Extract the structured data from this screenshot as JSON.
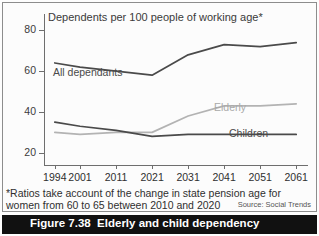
{
  "chart_data": {
    "type": "line",
    "title": "Dependents per 100 people of working age*",
    "xlabel": "",
    "ylabel": "",
    "x": [
      1994,
      2001,
      2011,
      2021,
      2031,
      2041,
      2051,
      2061
    ],
    "xticklabels": [
      "1994",
      "2001",
      "2011",
      "2021",
      "2031",
      "2041",
      "2051",
      "2061"
    ],
    "yticklabels": [
      "20",
      "40",
      "60",
      "80"
    ],
    "yticks": [
      20,
      40,
      60,
      80
    ],
    "ylim": [
      14,
      88
    ],
    "xlim": [
      1991,
      2064
    ],
    "grid": false,
    "legend": "inline-labels",
    "series": [
      {
        "name": "All dependants",
        "color": "#4a4a4a",
        "values": [
          64,
          62,
          60,
          58,
          68,
          73,
          72,
          74
        ]
      },
      {
        "name": "Elderly",
        "color": "#b3b3b3",
        "values": [
          30,
          29,
          30,
          30,
          38,
          43,
          43,
          44
        ]
      },
      {
        "name": "Children",
        "color": "#4a4a4a",
        "values": [
          35,
          33,
          31,
          28,
          29,
          29,
          29,
          29
        ]
      }
    ],
    "annotations": {
      "footnote": "*Ratios take account of the change in state pension age for women from 60 to 65 between 2010 and 2020",
      "source": "Source: Social Trends"
    }
  },
  "caption": {
    "number": "Figure 7.38",
    "text": "Elderly and child dependency"
  }
}
